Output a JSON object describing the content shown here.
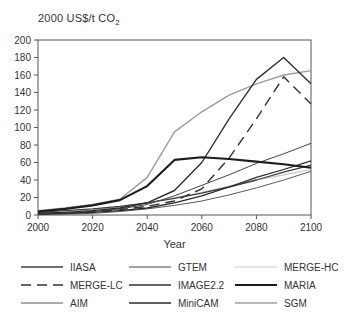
{
  "figure": {
    "title_main": "2000 US$/t CO",
    "title_sub": "2",
    "xaxis_label": "Year"
  },
  "chart_data": {
    "type": "line",
    "title": "2000 US$/t CO2",
    "xlabel": "Year",
    "ylabel": "2000 US$/t CO2",
    "xlim": [
      2000,
      2100
    ],
    "ylim": [
      0,
      200
    ],
    "xticks": [
      2000,
      2020,
      2040,
      2060,
      2080,
      2100
    ],
    "yticks": [
      0,
      20,
      40,
      60,
      80,
      100,
      120,
      140,
      160,
      180,
      200
    ],
    "grid": false,
    "legend_position": "bottom",
    "x": [
      2000,
      2010,
      2020,
      2030,
      2040,
      2050,
      2060,
      2070,
      2080,
      2090,
      2100
    ],
    "series": [
      {
        "name": "AIM",
        "color": "#5a5a5a",
        "width": 1,
        "dash": "",
        "values": [
          1,
          1,
          2,
          4,
          7,
          11,
          16,
          23,
          31,
          40,
          50
        ]
      },
      {
        "name": "MERGE-HC",
        "color": "#c7c7c7",
        "width": 1.2,
        "dash": "",
        "values": [
          2,
          4,
          6,
          9,
          14,
          20,
          26,
          33,
          40,
          46,
          52
        ]
      },
      {
        "name": "IIASA",
        "color": "#3f3f3f",
        "width": 1.3,
        "dash": "",
        "values": [
          3,
          5,
          7,
          10,
          14,
          19,
          25,
          32,
          40,
          49,
          57
        ]
      },
      {
        "name": "GTEM",
        "color": "#444444",
        "width": 1,
        "dash": "",
        "values": [
          1,
          2,
          4,
          7,
          12,
          22,
          34,
          46,
          59,
          70,
          82
        ]
      },
      {
        "name": "MiniCAM",
        "color": "#2a2a2a",
        "width": 1.3,
        "dash": "",
        "values": [
          1,
          2,
          3,
          5,
          8,
          14,
          22,
          32,
          43,
          52,
          62
        ]
      },
      {
        "name": "SGM",
        "color": "#9c9c9c",
        "width": 1.4,
        "dash": "",
        "values": [
          5,
          8,
          12,
          18,
          43,
          95,
          118,
          137,
          150,
          160,
          165
        ]
      },
      {
        "name": "IMAGE2.2",
        "color": "#303030",
        "width": 1.4,
        "dash": "",
        "values": [
          2,
          3,
          5,
          8,
          14,
          28,
          60,
          110,
          155,
          180,
          150
        ]
      },
      {
        "name": "MARIA",
        "color": "#1c1c1c",
        "width": 2.1,
        "dash": "",
        "values": [
          4,
          7,
          11,
          17,
          33,
          63,
          66,
          64,
          61,
          58,
          54
        ]
      },
      {
        "name": "MERGE-LC",
        "color": "#333333",
        "width": 1.4,
        "dash": "10,6",
        "values": [
          1,
          2,
          4,
          6,
          10,
          16,
          30,
          65,
          110,
          158,
          127
        ]
      }
    ],
    "legend_columns": [
      [
        "IIASA",
        "MERGE-LC",
        "AIM"
      ],
      [
        "GTEM",
        "IMAGE2.2",
        "MiniCAM"
      ],
      [
        "MERGE-HC",
        "MARIA",
        "SGM"
      ]
    ]
  }
}
